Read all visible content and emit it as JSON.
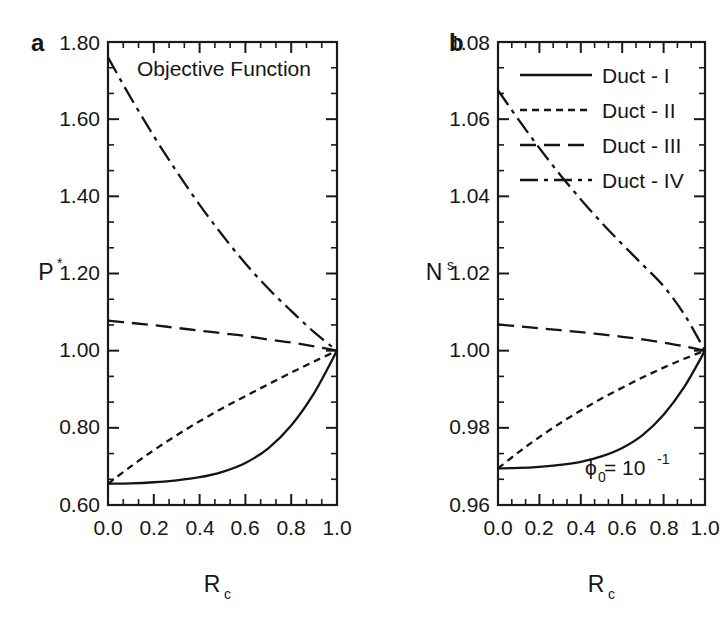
{
  "figure": {
    "background": "#ffffff",
    "ink_color": "#141414"
  },
  "panels": [
    {
      "letter": "a",
      "annotation": "Objective Function",
      "xlabel_base": "R",
      "xlabel_sub": "c",
      "ylabel_base": "P",
      "ylabel_sup": "*",
      "ylabel_sub": "",
      "x_ticks": [
        "0.0",
        "0.2",
        "0.4",
        "0.6",
        "0.8",
        "1.0"
      ],
      "y_ticks": [
        "0.60",
        "0.80",
        "1.00",
        "1.20",
        "1.40",
        "1.60",
        "1.80"
      ]
    },
    {
      "letter": "b",
      "annotation_base": "ϕ",
      "annotation_sub": "0",
      "annotation_mid": " = 10",
      "annotation_sup": "-1",
      "xlabel_base": "R",
      "xlabel_sub": "c",
      "ylabel_base": "N",
      "ylabel_sub": "s",
      "ylabel_sup": "",
      "x_ticks": [
        "0.0",
        "0.2",
        "0.4",
        "0.6",
        "0.8",
        "1.0"
      ],
      "y_ticks": [
        "0.96",
        "0.98",
        "1.00",
        "1.02",
        "1.04",
        "1.06",
        "1.08"
      ]
    }
  ],
  "legend": {
    "position": "top-right-panel-b",
    "entries": [
      {
        "label": "Duct - I",
        "dash": "none",
        "style": "solid"
      },
      {
        "label": "Duct - II",
        "dash": "7,5",
        "style": "short-dash"
      },
      {
        "label": "Duct - III",
        "dash": "16,8",
        "style": "long-dash"
      },
      {
        "label": "Duct - IV",
        "dash": "18,6,4,6",
        "style": "dash-dot"
      }
    ]
  },
  "chart_data": [
    {
      "type": "line",
      "panel": "a",
      "title": "Objective Function",
      "xlabel": "R_c",
      "ylabel": "P*",
      "xlim": [
        0.0,
        1.0
      ],
      "ylim": [
        0.6,
        1.8
      ],
      "xticks": [
        0.0,
        0.2,
        0.4,
        0.6,
        0.8,
        1.0
      ],
      "yticks": [
        0.6,
        0.8,
        1.0,
        1.2,
        1.4,
        1.6,
        1.8
      ],
      "minor_ticks_per_interval": 2,
      "grid": false,
      "legend_position": "none",
      "x": [
        0.0,
        0.1,
        0.2,
        0.3,
        0.4,
        0.5,
        0.6,
        0.7,
        0.8,
        0.9,
        1.0
      ],
      "series": [
        {
          "name": "Duct - I",
          "dash": "none",
          "values": [
            0.655,
            0.656,
            0.659,
            0.664,
            0.672,
            0.686,
            0.709,
            0.747,
            0.806,
            0.89,
            1.0
          ]
        },
        {
          "name": "Duct - II",
          "dash": "7,5",
          "values": [
            0.655,
            0.7,
            0.742,
            0.781,
            0.817,
            0.851,
            0.882,
            0.913,
            0.943,
            0.972,
            1.0
          ]
        },
        {
          "name": "Duct - III",
          "dash": "16,8",
          "values": [
            1.078,
            1.072,
            1.066,
            1.059,
            1.052,
            1.045,
            1.038,
            1.029,
            1.021,
            1.011,
            1.0
          ]
        },
        {
          "name": "Duct - IV",
          "dash": "18,6,4,6",
          "values": [
            1.76,
            1.655,
            1.556,
            1.464,
            1.378,
            1.299,
            1.226,
            1.161,
            1.103,
            1.048,
            1.0
          ]
        }
      ]
    },
    {
      "type": "line",
      "panel": "b",
      "title": "",
      "annotation": "phi_0 = 10^-1",
      "xlabel": "R_c",
      "ylabel": "N_s",
      "xlim": [
        0.0,
        1.0
      ],
      "ylim": [
        0.96,
        1.08
      ],
      "xticks": [
        0.0,
        0.2,
        0.4,
        0.6,
        0.8,
        1.0
      ],
      "yticks": [
        0.96,
        0.98,
        1.0,
        1.02,
        1.04,
        1.06,
        1.08
      ],
      "minor_ticks_per_interval": 2,
      "grid": false,
      "legend_position": "upper-right",
      "x": [
        0.0,
        0.1,
        0.2,
        0.3,
        0.4,
        0.5,
        0.6,
        0.7,
        0.8,
        0.9,
        1.0
      ],
      "series": [
        {
          "name": "Duct - I",
          "dash": "none",
          "values": [
            0.9695,
            0.9696,
            0.9699,
            0.9704,
            0.9712,
            0.9726,
            0.9748,
            0.9782,
            0.9834,
            0.9906,
            1.0
          ]
        },
        {
          "name": "Duct - II",
          "dash": "7,5",
          "values": [
            0.9695,
            0.9737,
            0.9776,
            0.9812,
            0.9845,
            0.9876,
            0.9904,
            0.9931,
            0.9956,
            0.9979,
            1.0
          ]
        },
        {
          "name": "Duct - III",
          "dash": "16,8",
          "values": [
            1.0068,
            1.0063,
            1.0058,
            1.0053,
            1.0048,
            1.0042,
            1.0036,
            1.0029,
            1.0021,
            1.0011,
            1.0
          ]
        },
        {
          "name": "Duct - IV",
          "dash": "18,6,4,6",
          "values": [
            1.0675,
            1.0598,
            1.0525,
            1.0456,
            1.0392,
            1.0332,
            1.0276,
            1.0222,
            1.0167,
            1.0094,
            1.0
          ]
        }
      ]
    }
  ]
}
